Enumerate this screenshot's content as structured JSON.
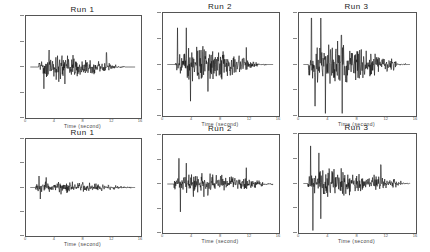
{
  "chart_data": [
    {
      "type": "line",
      "title": "Run 1",
      "xlabel": "Time (second)",
      "ylabel": "",
      "xticks": [
        "0",
        "4",
        "8",
        "12",
        "16"
      ],
      "xlim": [
        0,
        16
      ],
      "ylim": [
        -1,
        1
      ],
      "grid": false,
      "row": 1,
      "col": 1,
      "amp": 0.45,
      "peaks": [
        {
          "t": 2.5,
          "a": -0.45
        },
        {
          "t": 3.2,
          "a": 0.35
        },
        {
          "t": 5.4,
          "a": -0.35
        },
        {
          "t": 11.2,
          "a": 0.3
        }
      ],
      "active_range": [
        1.8,
        12.5
      ]
    },
    {
      "type": "line",
      "title": "Run 2",
      "xlabel": "Time (second)",
      "ylabel": "",
      "xticks": [
        "0",
        "4",
        "8",
        "12",
        "16"
      ],
      "xlim": [
        0,
        16
      ],
      "ylim": [
        -1,
        1
      ],
      "grid": false,
      "row": 1,
      "col": 2,
      "amp": 0.7,
      "peaks": [
        {
          "t": 2.0,
          "a": 0.75
        },
        {
          "t": 3.2,
          "a": 0.75
        },
        {
          "t": 3.8,
          "a": -0.75
        },
        {
          "t": 6.2,
          "a": -0.55
        },
        {
          "t": 11.5,
          "a": 0.35
        }
      ],
      "active_range": [
        1.7,
        13.0
      ]
    },
    {
      "type": "line",
      "title": "Run 3",
      "xlabel": "Time (second)",
      "ylabel": "",
      "xticks": [
        "0",
        "4",
        "8",
        "12",
        "16"
      ],
      "xlim": [
        0,
        16
      ],
      "ylim": [
        -1,
        1
      ],
      "grid": false,
      "row": 1,
      "col": 3,
      "amp": 0.8,
      "peaks": [
        {
          "t": 1.7,
          "a": 0.95
        },
        {
          "t": 2.2,
          "a": -0.85
        },
        {
          "t": 3.0,
          "a": 0.95
        },
        {
          "t": 3.6,
          "a": -1.0
        },
        {
          "t": 5.8,
          "a": 0.6
        },
        {
          "t": 5.9,
          "a": -1.0
        }
      ],
      "active_range": [
        1.3,
        13.5
      ]
    },
    {
      "type": "line",
      "title": "Run 1",
      "xlabel": "Time (second)",
      "ylabel": "",
      "xticks": [
        "0",
        "4",
        "8",
        "12",
        "16"
      ],
      "xlim": [
        0,
        16
      ],
      "ylim": [
        -1,
        1
      ],
      "grid": false,
      "row": 2,
      "col": 1,
      "amp": 0.25,
      "peaks": [
        {
          "t": 1.8,
          "a": 0.25
        },
        {
          "t": 2.0,
          "a": -0.25
        },
        {
          "t": 2.8,
          "a": 0.22
        }
      ],
      "active_range": [
        1.3,
        13.5
      ]
    },
    {
      "type": "line",
      "title": "Run 2",
      "xlabel": "Time (second)",
      "ylabel": "",
      "xticks": [
        "0",
        "4",
        "8",
        "12",
        "16"
      ],
      "xlim": [
        0,
        16
      ],
      "ylim": [
        -1,
        1
      ],
      "grid": false,
      "row": 2,
      "col": 2,
      "amp": 0.45,
      "peaks": [
        {
          "t": 2.2,
          "a": 0.55
        },
        {
          "t": 2.4,
          "a": -0.6
        },
        {
          "t": 3.2,
          "a": 0.45
        },
        {
          "t": 11.5,
          "a": 0.35
        }
      ],
      "active_range": [
        1.5,
        14.0
      ]
    },
    {
      "type": "line",
      "title": "Run 3",
      "xlabel": "Time (second)",
      "ylabel": "",
      "xticks": [
        "0",
        "4",
        "8",
        "12",
        "16"
      ],
      "xlim": [
        0,
        16
      ],
      "ylim": [
        -1,
        1
      ],
      "grid": false,
      "row": 2,
      "col": 3,
      "amp": 0.55,
      "peaks": [
        {
          "t": 1.6,
          "a": 0.8
        },
        {
          "t": 1.9,
          "a": -1.0
        },
        {
          "t": 2.7,
          "a": 0.65
        },
        {
          "t": 3.0,
          "a": -0.75
        },
        {
          "t": 11.2,
          "a": 0.4
        }
      ],
      "active_range": [
        1.2,
        14.0
      ]
    }
  ],
  "panels": [
    {
      "title": "Run 1",
      "xlabel": "Time (second)",
      "xticks": [
        "0",
        "4",
        "8",
        "12",
        "16"
      ]
    },
    {
      "title": "Run 2",
      "xlabel": "Time (second)",
      "xticks": [
        "0",
        "4",
        "8",
        "12",
        "16"
      ]
    },
    {
      "title": "Run 3",
      "xlabel": "Time (second)",
      "xticks": [
        "0",
        "4",
        "8",
        "12",
        "16"
      ]
    },
    {
      "title": "Run 1",
      "xlabel": "Time (second)",
      "xticks": [
        "0",
        "4",
        "8",
        "12",
        "16"
      ]
    },
    {
      "title": "Run 2",
      "xlabel": "Time (second)",
      "xticks": [
        "0",
        "4",
        "8",
        "12",
        "16"
      ]
    },
    {
      "title": "Run 3",
      "xlabel": "Time (second)",
      "xticks": [
        "0",
        "4",
        "8",
        "12",
        "16"
      ]
    }
  ],
  "colors": {
    "trace": "#111111",
    "axis": "#555555"
  }
}
